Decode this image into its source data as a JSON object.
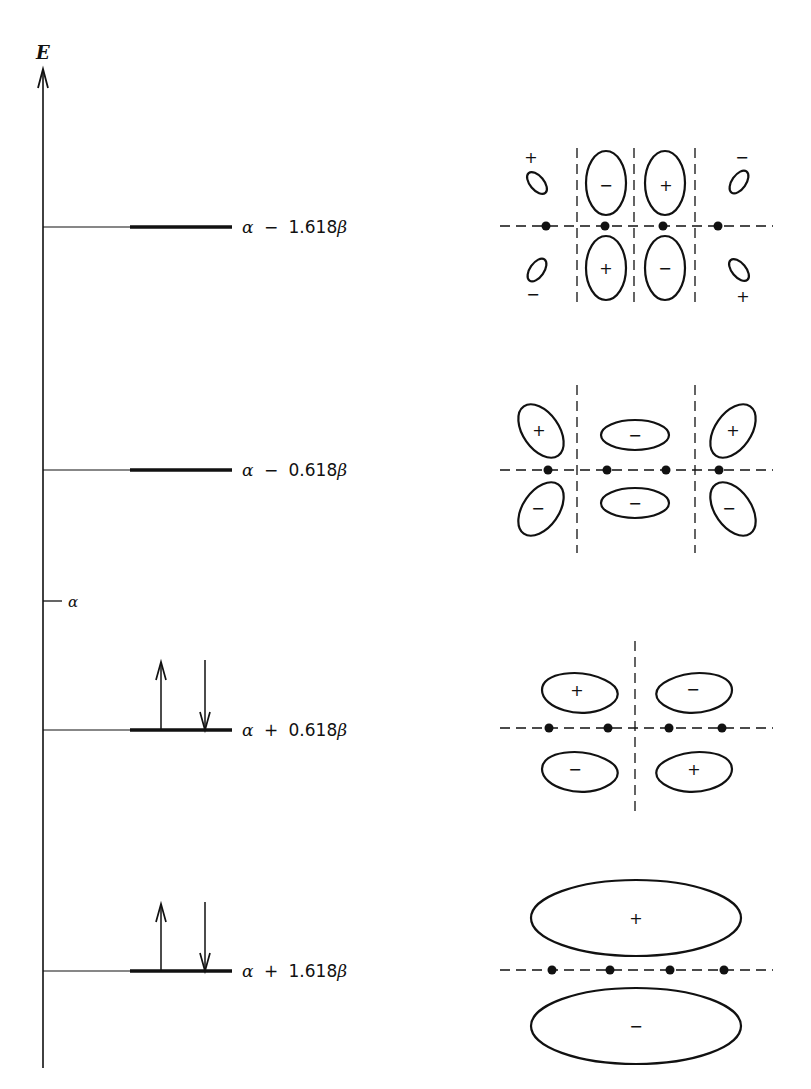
{
  "diagram": {
    "axis": {
      "label": "E",
      "reference_label": "α",
      "reference_y": 601
    },
    "levels": [
      {
        "id": "psi4",
        "energy": "α − 1.618β",
        "alpha": "α",
        "op": "−",
        "coef": "1.618",
        "beta": "β",
        "y": 227,
        "electrons": []
      },
      {
        "id": "psi3",
        "energy": "α − 0.618β",
        "alpha": "α",
        "op": "−",
        "coef": "0.618",
        "beta": "β",
        "y": 470,
        "electrons": []
      },
      {
        "id": "psi2",
        "energy": "α + 0.618β",
        "alpha": "α",
        "op": "+",
        "coef": "0.618",
        "beta": "β",
        "y": 730,
        "electrons": [
          "up",
          "down"
        ]
      },
      {
        "id": "psi1",
        "energy": "α + 1.618β",
        "alpha": "α",
        "op": "+",
        "coef": "1.618",
        "beta": "β",
        "y": 971,
        "electrons": [
          "up",
          "down"
        ]
      }
    ],
    "orbitals": [
      {
        "id": "psi4",
        "nodes": 3,
        "signs_top": [
          "+",
          "−",
          "+",
          "−"
        ],
        "signs_bottom": [
          "−",
          "+",
          "−",
          "+"
        ]
      },
      {
        "id": "psi3",
        "nodes": 2,
        "signs_top": [
          "+",
          "−",
          "+"
        ],
        "signs_bottom": [
          "−",
          "−",
          "−"
        ]
      },
      {
        "id": "psi2",
        "nodes": 1,
        "signs_top": [
          "+",
          "−"
        ],
        "signs_bottom": [
          "−",
          "+"
        ]
      },
      {
        "id": "psi1",
        "nodes": 0,
        "signs_top": [
          "+"
        ],
        "signs_bottom": [
          "−"
        ]
      }
    ],
    "colors": {
      "ink": "#111111",
      "background": "#ffffff"
    }
  }
}
